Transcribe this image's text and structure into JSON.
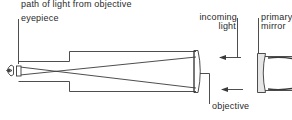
{
  "diagram": {
    "type": "refracting telescope schematic",
    "labels": {
      "path_of_light": "path of light from objective",
      "eyepiece": "eyepiece",
      "incoming_light_line1": "incoming",
      "incoming_light_line2": "light",
      "primary_mirror_line1": "primary",
      "primary_mirror_line2": "mirror",
      "objective": "objective"
    },
    "colors": {
      "line": "#3a3a3a",
      "text": "#2a2a2a",
      "mirror_fill": "#e6e6e6",
      "background": "#ffffff"
    }
  }
}
